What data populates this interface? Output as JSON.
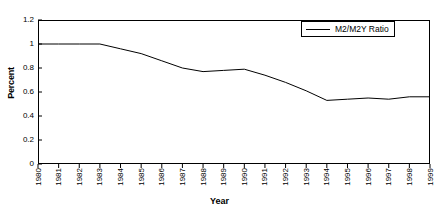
{
  "chart_data": {
    "type": "line",
    "title": "",
    "xlabel": "Year",
    "ylabel": "Percent",
    "legend_position": "top-right",
    "grid": false,
    "xlim": [
      1980,
      1999
    ],
    "ylim": [
      0,
      1.2
    ],
    "ytick_labels": [
      "1.2",
      "1",
      "0.8",
      "0.6",
      "0.4",
      "0.2",
      "0"
    ],
    "ytick_values": [
      1.2,
      1,
      0.8,
      0.6,
      0.4,
      0.2,
      0
    ],
    "categories": [
      "1980",
      "1981",
      "1982",
      "1983",
      "1984",
      "1985",
      "1986",
      "1987",
      "1988",
      "1989",
      "1990",
      "1991",
      "1992",
      "1993",
      "1994",
      "1995",
      "1996",
      "1997",
      "1998",
      "1999"
    ],
    "series": [
      {
        "name": "M2/M2Y Ratio",
        "color": "#000000",
        "values": [
          1.0,
          1.0,
          1.0,
          1.0,
          0.96,
          0.92,
          0.86,
          0.8,
          0.77,
          0.78,
          0.79,
          0.74,
          0.68,
          0.61,
          0.53,
          0.54,
          0.55,
          0.54,
          0.56,
          0.56
        ]
      }
    ]
  },
  "legend": {
    "entry_label": "M2/M2Y Ratio"
  },
  "axes": {
    "y_title": "Percent",
    "x_title": "Year"
  }
}
